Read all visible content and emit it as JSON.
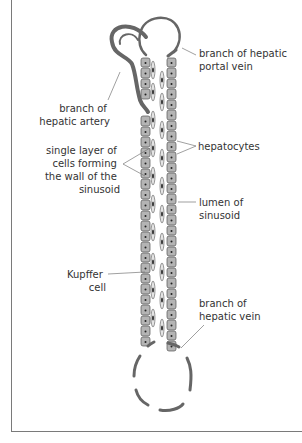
{
  "title": "Structure of a sinusoid in the liver",
  "colors": {
    "vessel": "#666666",
    "cell_fill": "#b4b4b4",
    "cell_stroke": "#555555",
    "frame": "#7a7a7a",
    "text": "#333333"
  },
  "labels": {
    "portal_vein": [
      "branch of hepatic",
      "portal vein"
    ],
    "hepatic_artery": [
      "branch of",
      "hepatic artery"
    ],
    "wall": [
      "single layer of",
      "cells forming",
      "the wall of the",
      "sinusoid"
    ],
    "hepatocytes": [
      "hepatocytes"
    ],
    "lumen": [
      "lumen of",
      "sinusoid"
    ],
    "kupffer": [
      "Kupffer",
      "cell"
    ],
    "hepatic_vein": [
      "branch of",
      "hepatic vein"
    ]
  }
}
